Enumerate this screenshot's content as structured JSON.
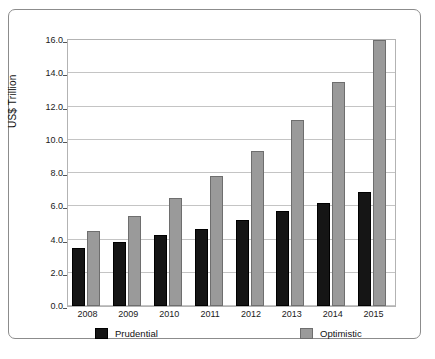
{
  "chart_data": {
    "type": "bar",
    "title": "",
    "subtitle": "",
    "xlabel": "",
    "ylabel": "US$ Trillion",
    "ylim": [
      0.0,
      16.0
    ],
    "ytick_step": 2.0,
    "ytick_labels": [
      "16.0",
      "14.0",
      "12.0",
      "10.0",
      "8.0",
      "6.0",
      "4.0",
      "2.0",
      "0.0"
    ],
    "ytick_values": [
      16.0,
      14.0,
      12.0,
      10.0,
      8.0,
      6.0,
      4.0,
      2.0,
      0.0
    ],
    "grid": "horizontal",
    "legend_position": "bottom",
    "categories": [
      "2008",
      "2009",
      "2010",
      "2011",
      "2012",
      "2013",
      "2014",
      "2015"
    ],
    "series": [
      {
        "name": "Prudential",
        "color": "#151515",
        "values": [
          3.5,
          3.85,
          4.25,
          4.65,
          5.15,
          5.7,
          6.2,
          6.85
        ]
      },
      {
        "name": "Optimistic",
        "color": "#9a9a9a",
        "values": [
          4.5,
          5.4,
          6.5,
          7.8,
          9.35,
          11.2,
          13.5,
          16.0
        ]
      }
    ]
  },
  "legend": {
    "entries": [
      {
        "label": "Prudential"
      },
      {
        "label": "Optimistic"
      }
    ]
  }
}
